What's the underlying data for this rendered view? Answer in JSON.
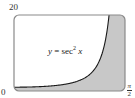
{
  "chart_data": {
    "type": "area",
    "title": "",
    "function_label": {
      "lhs": "y",
      "eq": "=",
      "fn": "sec",
      "exp": "2",
      "arg": "x"
    },
    "function": "sec^2(x)",
    "xlabel": "",
    "ylabel": "",
    "xlim": [
      0,
      1.5708
    ],
    "ylim": [
      0,
      20
    ],
    "x_ticks": [
      {
        "value": 0,
        "label": "0"
      },
      {
        "value": 1.5708,
        "label_num": "π",
        "label_den": "2"
      }
    ],
    "y_ticks": [
      {
        "value": 20,
        "label": "20"
      }
    ],
    "shaded_region": "between curve y = sec^2 x and the right/bottom frame (region below/right of curve)",
    "sample_points": [
      {
        "x": 0.0,
        "y": 1.0
      },
      {
        "x": 0.3,
        "y": 1.1
      },
      {
        "x": 0.6,
        "y": 1.47
      },
      {
        "x": 0.9,
        "y": 2.6
      },
      {
        "x": 1.1,
        "y": 4.12
      },
      {
        "x": 1.2,
        "y": 7.6
      },
      {
        "x": 1.25,
        "y": 9.94
      },
      {
        "x": 1.3,
        "y": 13.94
      },
      {
        "x": 1.3467,
        "y": 20.0
      }
    ],
    "grid": false,
    "legend": "none",
    "colors": {
      "curve": "#1a1a1a",
      "fill": "#c8c8c8",
      "frame": "#8a8a8a",
      "background": "#ffffff"
    }
  }
}
